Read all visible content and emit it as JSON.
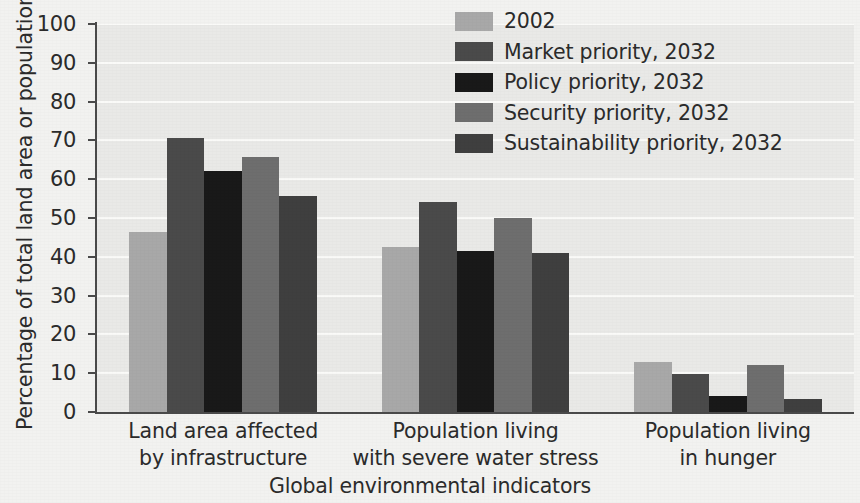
{
  "chart_data": {
    "type": "bar",
    "title": "",
    "subtitle": "",
    "xlabel": "Global environmental indicators",
    "ylabel": "Percentage of total land area or population",
    "ylim": [
      0,
      100
    ],
    "ytick_labels": [
      "0",
      "10",
      "20",
      "30",
      "40",
      "50",
      "60",
      "70",
      "80",
      "90",
      "100"
    ],
    "ytick_values": [
      0,
      10,
      20,
      30,
      40,
      50,
      60,
      70,
      80,
      90,
      100
    ],
    "grid": "horizontal",
    "legend_position": "upper-right-inside",
    "categories": [
      "Land area affected by infrastructure",
      "Population living with severe water stress",
      "Population living in hunger"
    ],
    "category_lines": [
      [
        "Land area affected",
        "by infrastructure"
      ],
      [
        "Population living",
        "with severe water stress"
      ],
      [
        "Population living",
        "in hunger"
      ]
    ],
    "series": [
      {
        "name": "2002",
        "color": "#a8a8a8",
        "values": [
          46.3,
          42.6,
          12.9
        ]
      },
      {
        "name": "Market priority, 2032",
        "color": "#4a4a4a",
        "values": [
          70.6,
          54.0,
          9.7
        ]
      },
      {
        "name": "Policy priority, 2032",
        "color": "#191919",
        "values": [
          62.1,
          41.6,
          4.1
        ]
      },
      {
        "name": "Security priority, 2032",
        "color": "#6e6e6e",
        "values": [
          65.6,
          50.1,
          12.0
        ]
      },
      {
        "name": "Sustainability priority, 2032",
        "color": "#3f3f3f",
        "values": [
          55.8,
          41.0,
          3.3
        ]
      }
    ]
  },
  "style": {
    "plot_background": "#e9e9e7",
    "page_background": "#f2f2f0",
    "gridline_color": "#fafaf8",
    "axis_color": "#4a4a4a",
    "text_color": "#2b2b2b"
  }
}
